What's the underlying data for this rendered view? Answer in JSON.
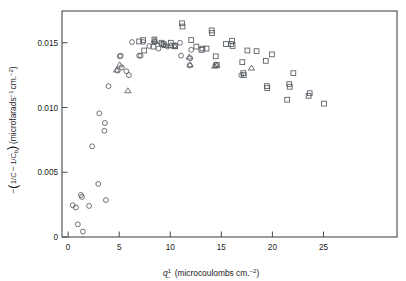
{
  "figure": {
    "title": "",
    "background_color": "#ffffff",
    "frame_color": "#4a4a4a",
    "marker_color": "#555a60"
  },
  "axes": {
    "x": {
      "label_symbol": "q",
      "label_superscript": "1",
      "label_subscript": "−",
      "label_units": "(microcoulombs cm.",
      "label_units_exp": "−2",
      "label_units_close": ")",
      "label_full": "q−¹ (microcoulombs cm.⁻²)",
      "ticks": [
        0,
        5,
        10,
        15,
        20,
        25
      ],
      "tick_labels": [
        "0",
        "5",
        "10",
        "15",
        "20",
        "25"
      ],
      "range": [
        -0.6,
        32.2
      ]
    },
    "y": {
      "label_lead": "−",
      "label_num1": "1",
      "label_den1": "C",
      "label_minus": "−",
      "label_num2": "1",
      "label_den2": "C",
      "label_den2_sub": "b",
      "label_units": "(microfarads",
      "label_units_exp1": "−1",
      "label_units_mid": "cm.",
      "label_units_exp2": "−2",
      "label_units_close": ")",
      "label_full": "−(1/C − 1/Cₑ) (microfarads⁻¹ cm.⁻²)",
      "ticks": [
        0,
        0.005,
        0.01,
        0.015
      ],
      "tick_labels": [
        "0",
        "0.005",
        "0.010",
        "0.015"
      ],
      "range": [
        0,
        0.01745
      ]
    }
  },
  "chart_data": {
    "type": "scatter",
    "title": "",
    "xlabel": "q−¹ (microcoulombs cm.⁻²)",
    "ylabel": "−(1/C − 1/Cₑ) (microfarads⁻¹ cm.⁻²)",
    "xlim": [
      -0.6,
      32.2
    ],
    "ylim": [
      0,
      0.01745
    ],
    "xticks": [
      0,
      5,
      10,
      15,
      20,
      25
    ],
    "yticks": [
      0,
      0.005,
      0.01,
      0.015
    ],
    "grid": false,
    "legend": "none",
    "series": [
      {
        "name": "circle-series",
        "marker": "circle",
        "points": [
          [
            0.45,
            0.00245
          ],
          [
            0.75,
            0.00228
          ],
          [
            0.95,
            0.00098
          ],
          [
            1.25,
            0.00325
          ],
          [
            1.35,
            0.0031
          ],
          [
            1.45,
            0.00042
          ],
          [
            2.05,
            0.0024
          ],
          [
            2.35,
            0.007
          ],
          [
            2.95,
            0.0041
          ],
          [
            3.05,
            0.00955
          ],
          [
            3.55,
            0.0082
          ],
          [
            3.6,
            0.0088
          ],
          [
            3.7,
            0.00285
          ],
          [
            3.95,
            0.01165
          ],
          [
            4.85,
            0.01285
          ],
          [
            5.05,
            0.01395
          ],
          [
            5.15,
            0.014
          ],
          [
            5.25,
            0.0131
          ],
          [
            5.7,
            0.0128
          ],
          [
            5.95,
            0.0125
          ],
          [
            6.25,
            0.01505
          ],
          [
            6.95,
            0.014
          ],
          [
            7.1,
            0.014
          ],
          [
            7.35,
            0.01505
          ],
          [
            7.95,
            0.01475
          ],
          [
            8.45,
            0.01505
          ],
          [
            8.85,
            0.01455
          ],
          [
            9.15,
            0.0149
          ],
          [
            9.35,
            0.0148
          ],
          [
            9.75,
            0.0147
          ],
          [
            10.45,
            0.0148
          ],
          [
            10.95,
            0.015
          ],
          [
            11.05,
            0.014
          ],
          [
            11.9,
            0.01325
          ],
          [
            11.95,
            0.0138
          ],
          [
            12.05,
            0.01445
          ],
          [
            14.45,
            0.0133
          ],
          [
            16.95,
            0.0125
          ]
        ]
      },
      {
        "name": "triangle-series",
        "marker": "triangle",
        "points": [
          [
            4.75,
            0.0129
          ],
          [
            5.05,
            0.0133
          ],
          [
            5.85,
            0.0113
          ],
          [
            8.45,
            0.0152
          ],
          [
            8.55,
            0.0151
          ],
          [
            9.55,
            0.0148
          ],
          [
            10.05,
            0.0148
          ],
          [
            10.45,
            0.0147
          ],
          [
            11.85,
            0.0139
          ],
          [
            11.95,
            0.0133
          ],
          [
            14.35,
            0.0132
          ],
          [
            14.55,
            0.01325
          ],
          [
            17.95,
            0.01305
          ]
        ]
      },
      {
        "name": "square-series",
        "marker": "square",
        "points": [
          [
            6.95,
            0.0151
          ],
          [
            7.35,
            0.0152
          ],
          [
            7.45,
            0.0144
          ],
          [
            8.35,
            0.0147
          ],
          [
            8.45,
            0.01525
          ],
          [
            9.15,
            0.015
          ],
          [
            9.35,
            0.0149
          ],
          [
            10.05,
            0.015
          ],
          [
            10.45,
            0.01475
          ],
          [
            11.15,
            0.0165
          ],
          [
            11.2,
            0.01625
          ],
          [
            12.05,
            0.0152
          ],
          [
            12.55,
            0.0147
          ],
          [
            13.05,
            0.01445
          ],
          [
            13.15,
            0.01455
          ],
          [
            13.55,
            0.01455
          ],
          [
            14.05,
            0.01595
          ],
          [
            14.1,
            0.01575
          ],
          [
            14.45,
            0.01395
          ],
          [
            14.55,
            0.0133
          ],
          [
            15.45,
            0.0149
          ],
          [
            15.95,
            0.0149
          ],
          [
            16.05,
            0.01515
          ],
          [
            16.1,
            0.01475
          ],
          [
            17.05,
            0.0135
          ],
          [
            17.15,
            0.01265
          ],
          [
            17.2,
            0.0125
          ],
          [
            17.55,
            0.0144
          ],
          [
            18.45,
            0.01435
          ],
          [
            19.35,
            0.0136
          ],
          [
            19.45,
            0.01165
          ],
          [
            19.5,
            0.0115
          ],
          [
            19.95,
            0.0141
          ],
          [
            21.45,
            0.0106
          ],
          [
            21.65,
            0.0118
          ],
          [
            21.7,
            0.0116
          ],
          [
            22.05,
            0.01265
          ],
          [
            23.55,
            0.0109
          ],
          [
            23.65,
            0.0111
          ],
          [
            25.05,
            0.0103
          ]
        ]
      }
    ]
  }
}
